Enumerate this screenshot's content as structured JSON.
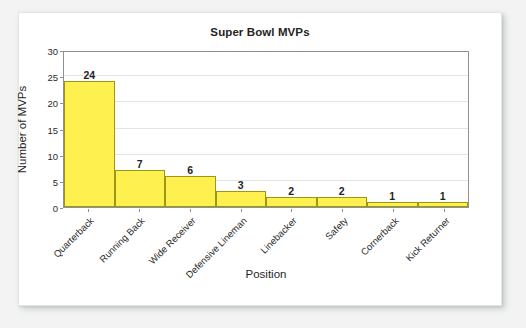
{
  "chart_data": {
    "type": "bar",
    "title": "Super Bowl MVPs",
    "xlabel": "Position",
    "ylabel": "Number of MVPs",
    "categories": [
      "Quarterback",
      "Running Back",
      "Wide Receiver",
      "Defensive Lineman",
      "Linebacker",
      "Safety",
      "Cornerback",
      "Kick Returner"
    ],
    "values": [
      24,
      7,
      6,
      3,
      2,
      2,
      1,
      1
    ],
    "value_labels": [
      "24",
      "7",
      "6",
      "3",
      "2",
      "2",
      "1",
      "1"
    ],
    "ylim": [
      0,
      30
    ],
    "y_ticks": [
      0,
      5,
      10,
      15,
      20,
      25,
      30
    ],
    "y_tick_labels": [
      "0",
      "5",
      "10",
      "15",
      "20",
      "25",
      "30"
    ],
    "grid": true,
    "legend": false,
    "bar_fill_color": "#fdf04f",
    "bar_edge_color": "#9d9716",
    "gridline_color": "#e4e4e4",
    "axis_color": "#8d9194",
    "text_color": "#1f1f1f",
    "plot_background": "#ffffff",
    "card_background": "#ffffff",
    "page_background": "#f3f3f3"
  }
}
